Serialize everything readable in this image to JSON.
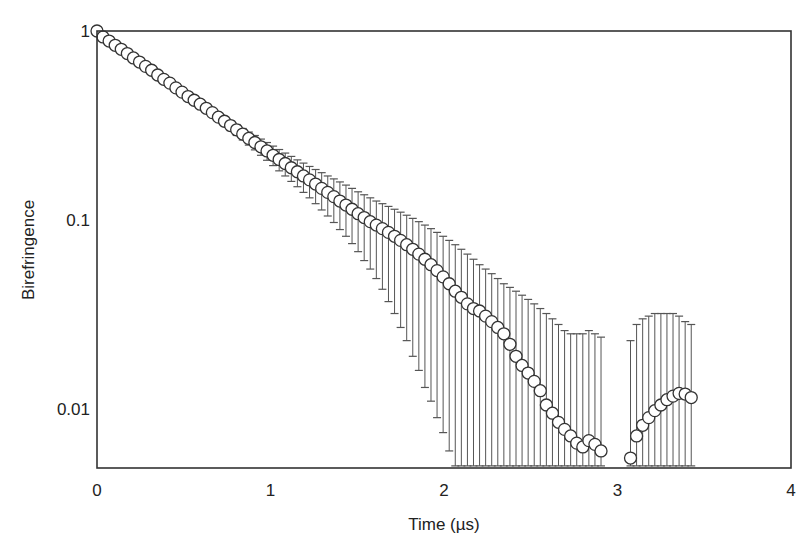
{
  "chart_data": {
    "type": "scatter",
    "title": "",
    "xlabel": "Time (µs)",
    "ylabel": "Birefringence",
    "xlim": [
      0,
      4
    ],
    "ylim": [
      0.005,
      1
    ],
    "yscale": "log",
    "grid": false,
    "legend": null,
    "x_ticks": [
      0,
      1,
      2,
      3,
      4
    ],
    "x_tick_labels": [
      "0",
      "1",
      "2",
      "3",
      "4"
    ],
    "y_ticks": [
      1,
      0.1,
      0.01
    ],
    "y_tick_labels": [
      "1",
      "0.1",
      "0.01"
    ],
    "marker": "open-circle",
    "error_bars": "vertical with caps, growing with time; lower bars truncated at axis bottom beyond ~2 µs",
    "series": [
      {
        "name": "Birefringence",
        "x": [
          0.0,
          0.035,
          0.07,
          0.105,
          0.14,
          0.175,
          0.21,
          0.245,
          0.28,
          0.315,
          0.35,
          0.385,
          0.42,
          0.455,
          0.49,
          0.525,
          0.56,
          0.595,
          0.63,
          0.665,
          0.7,
          0.735,
          0.77,
          0.805,
          0.84,
          0.875,
          0.91,
          0.945,
          0.98,
          1.015,
          1.05,
          1.085,
          1.12,
          1.155,
          1.19,
          1.225,
          1.26,
          1.295,
          1.33,
          1.365,
          1.4,
          1.435,
          1.47,
          1.505,
          1.54,
          1.575,
          1.61,
          1.645,
          1.68,
          1.715,
          1.75,
          1.785,
          1.82,
          1.855,
          1.89,
          1.925,
          1.96,
          1.995,
          2.03,
          2.065,
          2.1,
          2.135,
          2.17,
          2.205,
          2.24,
          2.275,
          2.31,
          2.345,
          2.38,
          2.415,
          2.45,
          2.485,
          2.52,
          2.555,
          2.59,
          2.625,
          2.66,
          2.695,
          2.73,
          2.765,
          2.8,
          2.835,
          2.87,
          2.905,
          3.075,
          3.11,
          3.145,
          3.18,
          3.215,
          3.25,
          3.285,
          3.32,
          3.355,
          3.39,
          3.425
        ],
        "y": [
          1.0,
          0.93,
          0.885,
          0.84,
          0.8,
          0.76,
          0.72,
          0.685,
          0.65,
          0.62,
          0.585,
          0.555,
          0.53,
          0.5,
          0.475,
          0.45,
          0.43,
          0.41,
          0.39,
          0.37,
          0.35,
          0.333,
          0.316,
          0.3,
          0.285,
          0.27,
          0.257,
          0.244,
          0.232,
          0.22,
          0.209,
          0.199,
          0.189,
          0.18,
          0.171,
          0.163,
          0.155,
          0.147,
          0.14,
          0.133,
          0.126,
          0.12,
          0.114,
          0.108,
          0.103,
          0.098,
          0.094,
          0.09,
          0.086,
          0.082,
          0.078,
          0.074,
          0.07,
          0.066,
          0.062,
          0.058,
          0.054,
          0.05,
          0.046,
          0.042,
          0.039,
          0.036,
          0.034,
          0.033,
          0.031,
          0.029,
          0.027,
          0.025,
          0.022,
          0.019,
          0.017,
          0.0155,
          0.014,
          0.0125,
          0.0105,
          0.0095,
          0.0085,
          0.0078,
          0.0072,
          0.0066,
          0.0063,
          0.0068,
          0.0065,
          0.006,
          0.0055,
          0.0072,
          0.0082,
          0.009,
          0.0098,
          0.0105,
          0.0112,
          0.0117,
          0.0121,
          0.012,
          0.0115
        ],
        "y_upper": [
          1.0,
          0.93,
          0.885,
          0.84,
          0.8,
          0.76,
          0.72,
          0.685,
          0.65,
          0.62,
          0.585,
          0.555,
          0.53,
          0.5,
          0.475,
          0.45,
          0.43,
          0.41,
          0.4,
          0.38,
          0.365,
          0.35,
          0.335,
          0.32,
          0.305,
          0.292,
          0.28,
          0.268,
          0.257,
          0.246,
          0.236,
          0.226,
          0.217,
          0.208,
          0.2,
          0.192,
          0.185,
          0.178,
          0.171,
          0.165,
          0.159,
          0.153,
          0.147,
          0.141,
          0.136,
          0.131,
          0.126,
          0.122,
          0.118,
          0.114,
          0.11,
          0.106,
          0.102,
          0.098,
          0.094,
          0.09,
          0.086,
          0.082,
          0.078,
          0.074,
          0.07,
          0.066,
          0.062,
          0.058,
          0.055,
          0.052,
          0.049,
          0.046,
          0.044,
          0.042,
          0.04,
          0.038,
          0.036,
          0.034,
          0.032,
          0.03,
          0.028,
          0.026,
          0.025,
          0.025,
          0.025,
          0.026,
          0.025,
          0.024,
          0.023,
          0.028,
          0.03,
          0.031,
          0.032,
          0.032,
          0.032,
          0.032,
          0.031,
          0.029,
          0.028
        ],
        "y_lower": [
          1.0,
          0.93,
          0.885,
          0.84,
          0.8,
          0.76,
          0.72,
          0.685,
          0.65,
          0.62,
          0.585,
          0.555,
          0.53,
          0.5,
          0.475,
          0.45,
          0.43,
          0.41,
          0.38,
          0.36,
          0.335,
          0.315,
          0.297,
          0.28,
          0.265,
          0.249,
          0.235,
          0.22,
          0.207,
          0.194,
          0.182,
          0.171,
          0.16,
          0.15,
          0.14,
          0.131,
          0.122,
          0.113,
          0.105,
          0.097,
          0.089,
          0.082,
          0.075,
          0.068,
          0.061,
          0.055,
          0.049,
          0.043,
          0.037,
          0.032,
          0.027,
          0.023,
          0.019,
          0.016,
          0.013,
          0.011,
          0.009,
          0.0075,
          0.006,
          0.005,
          0.005,
          0.005,
          0.005,
          0.005,
          0.005,
          0.005,
          0.005,
          0.005,
          0.005,
          0.005,
          0.005,
          0.005,
          0.005,
          0.005,
          0.005,
          0.005,
          0.005,
          0.005,
          0.005,
          0.005,
          0.005,
          0.005,
          0.005,
          0.005,
          0.005,
          0.005,
          0.005,
          0.005,
          0.005,
          0.005,
          0.005,
          0.005,
          0.005,
          0.005,
          0.005
        ]
      }
    ]
  },
  "colors": {
    "background": "#ffffff",
    "axis": "#333333",
    "marker_edge": "#333333",
    "marker_fill": "#ffffff",
    "error_bar": "#555555"
  }
}
